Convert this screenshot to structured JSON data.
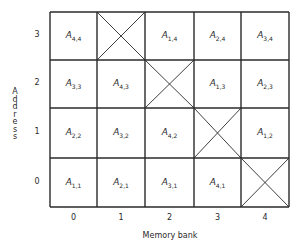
{
  "diagram": {
    "x_axis_title": "Memory bank",
    "y_axis_title": "Address",
    "columns": [
      "0",
      "1",
      "2",
      "3",
      "4"
    ],
    "rows": [
      "0",
      "1",
      "2",
      "3"
    ],
    "line_color": "#2a2a2a",
    "cells": [
      {
        "row": 3,
        "col": 0,
        "base": "A",
        "sub": "4,4",
        "crossed": false
      },
      {
        "row": 3,
        "col": 1,
        "base": "",
        "sub": "",
        "crossed": true
      },
      {
        "row": 3,
        "col": 2,
        "base": "A",
        "sub": "1,4",
        "crossed": false
      },
      {
        "row": 3,
        "col": 3,
        "base": "A",
        "sub": "2,4",
        "crossed": false
      },
      {
        "row": 3,
        "col": 4,
        "base": "A",
        "sub": "3,4",
        "crossed": false
      },
      {
        "row": 2,
        "col": 0,
        "base": "A",
        "sub": "3,3",
        "crossed": false
      },
      {
        "row": 2,
        "col": 1,
        "base": "A",
        "sub": "4,3",
        "crossed": false
      },
      {
        "row": 2,
        "col": 2,
        "base": "",
        "sub": "",
        "crossed": true
      },
      {
        "row": 2,
        "col": 3,
        "base": "A",
        "sub": "1,3",
        "crossed": false
      },
      {
        "row": 2,
        "col": 4,
        "base": "A",
        "sub": "2,3",
        "crossed": false
      },
      {
        "row": 1,
        "col": 0,
        "base": "A",
        "sub": "2,2",
        "crossed": false
      },
      {
        "row": 1,
        "col": 1,
        "base": "A",
        "sub": "3,2",
        "crossed": false
      },
      {
        "row": 1,
        "col": 2,
        "base": "A",
        "sub": "4,2",
        "crossed": false
      },
      {
        "row": 1,
        "col": 3,
        "base": "",
        "sub": "",
        "crossed": true
      },
      {
        "row": 1,
        "col": 4,
        "base": "A",
        "sub": "1,2",
        "crossed": false
      },
      {
        "row": 0,
        "col": 0,
        "base": "A",
        "sub": "1,1",
        "crossed": false
      },
      {
        "row": 0,
        "col": 1,
        "base": "A",
        "sub": "2,1",
        "crossed": false
      },
      {
        "row": 0,
        "col": 2,
        "base": "A",
        "sub": "3,1",
        "crossed": false
      },
      {
        "row": 0,
        "col": 3,
        "base": "A",
        "sub": "4,1",
        "crossed": false
      },
      {
        "row": 0,
        "col": 4,
        "base": "",
        "sub": "",
        "crossed": true
      }
    ]
  }
}
